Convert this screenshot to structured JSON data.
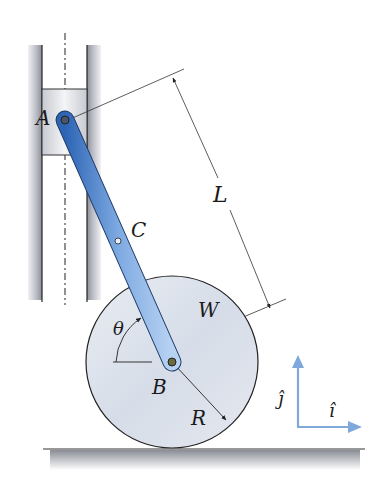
{
  "diagram": {
    "type": "mechanism",
    "labels": {
      "point_a": "A",
      "point_b": "B",
      "point_c": "C",
      "length": "L",
      "weight": "W",
      "angle": "θ",
      "radius": "R",
      "unit_j": "ĵ",
      "unit_i": "î"
    },
    "colors": {
      "bar": "#3a78c8",
      "bar_light": "#a8c8ee",
      "wheel": "#dde4ee",
      "guide": "#c9ccd2",
      "unit_vectors": "#7fa9dc",
      "ground": "#8e9099"
    }
  }
}
